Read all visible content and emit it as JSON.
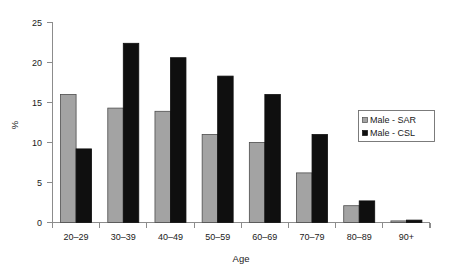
{
  "chart_data": {
    "type": "bar",
    "title": "",
    "xlabel": "Age",
    "ylabel": "%",
    "ylim": [
      0,
      25
    ],
    "yticks": [
      0,
      5,
      10,
      15,
      20,
      25
    ],
    "ytick_labels": [
      "0",
      "5",
      "10",
      "15",
      "20",
      "25"
    ],
    "grid": false,
    "legend_position": "right-middle",
    "categories": [
      "20–29",
      "30–39",
      "40–49",
      "50–59",
      "60–69",
      "70–79",
      "80–89",
      "90+"
    ],
    "series": [
      {
        "name": "Male - SAR",
        "color": "#a3a3a3",
        "values": [
          16.0,
          14.3,
          13.9,
          11.0,
          10.0,
          6.2,
          2.1,
          0.2
        ]
      },
      {
        "name": "Male - CSL",
        "color": "#0f0f0f",
        "values": [
          9.2,
          22.4,
          20.6,
          18.3,
          16.0,
          11.0,
          2.7,
          0.3
        ]
      }
    ]
  },
  "legend": {
    "entries": [
      {
        "label": "Male - SAR"
      },
      {
        "label": "Male - CSL"
      }
    ]
  },
  "axes": {
    "y_title": "%",
    "x_title": "Age"
  }
}
